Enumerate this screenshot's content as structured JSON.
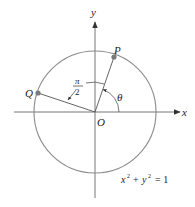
{
  "figure": {
    "axes": {
      "x_label": "x",
      "y_label": "y",
      "origin_label": "O"
    },
    "circle": {
      "equation_lhs_x": "x",
      "equation_sup_x": "2",
      "equation_plus": "+",
      "equation_lhs_y": "y",
      "equation_sup_y": "2",
      "equation_rhs": "= 1",
      "color": "#8a8a8a"
    },
    "points": [
      {
        "label": "P",
        "color": "#7a7a7a"
      },
      {
        "label": "Q",
        "color": "#7a7a7a"
      }
    ],
    "angles": {
      "theta_label": "θ",
      "right_angle_numerator": "π",
      "right_angle_denominator": "2"
    },
    "axis_color": "#777777"
  }
}
